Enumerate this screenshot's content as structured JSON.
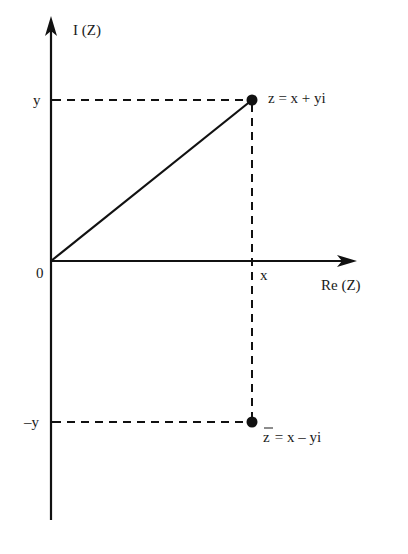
{
  "diagram": {
    "colors": {
      "stroke": "#111111",
      "text": "#1a1a1a",
      "background": "#ffffff"
    },
    "axes": {
      "vertical_label": "I (Z)",
      "horizontal_label": "Re (Z)",
      "origin_label": "0"
    },
    "ticks": {
      "y_positive": "y",
      "y_negative": "–y",
      "x": "x"
    },
    "points": [
      {
        "name": "z",
        "label": "z = x + yi",
        "position": "upper"
      },
      {
        "name": "z-conjugate",
        "label_bar": "z",
        "label_rest": " = x – yi",
        "position": "lower"
      }
    ]
  }
}
